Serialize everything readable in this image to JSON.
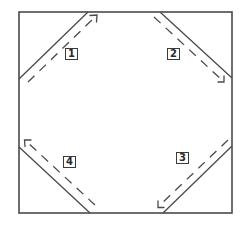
{
  "diagram": {
    "stroke_color": "#4a4a4a",
    "labels": [
      {
        "id": "step-1",
        "text": "1",
        "position": "top-left"
      },
      {
        "id": "step-2",
        "text": "2",
        "position": "top-right"
      },
      {
        "id": "step-3",
        "text": "3",
        "position": "bottom-right"
      },
      {
        "id": "step-4",
        "text": "4",
        "position": "bottom-left"
      }
    ],
    "folds": [
      {
        "step": "1",
        "corner": "top-left",
        "arrow_direction": "up-right"
      },
      {
        "step": "2",
        "corner": "top-right",
        "arrow_direction": "down-right"
      },
      {
        "step": "3",
        "corner": "bottom-right",
        "arrow_direction": "down-left"
      },
      {
        "step": "4",
        "corner": "bottom-left",
        "arrow_direction": "up-left"
      }
    ]
  }
}
